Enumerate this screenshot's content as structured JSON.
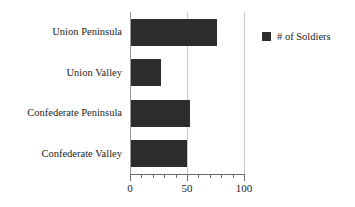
{
  "chart_data": {
    "type": "bar",
    "orientation": "horizontal",
    "title": "",
    "xlabel": "",
    "ylabel": "",
    "categories": [
      "Union Peninsula",
      "Union Valley",
      "Confederate Peninsula",
      "Confederate Valley"
    ],
    "values": [
      75,
      26,
      52,
      49
    ],
    "series": [
      {
        "name": "# of Soldiers",
        "values": [
          75,
          26,
          52,
          49
        ],
        "color": "#2c2c2c"
      }
    ],
    "xlim": [
      0,
      100
    ],
    "xticks": [
      0,
      50,
      100
    ],
    "xticklabels": [
      "0",
      "50",
      "100"
    ],
    "minor_tick_step": 10,
    "grid": true,
    "grid_axis": "x",
    "grid_color": "#c9c9c9",
    "legend": {
      "position": "right",
      "entries": [
        {
          "label": "# of Soldiers",
          "color": "#2c2c2c",
          "marker": "square"
        }
      ]
    },
    "background": "#ffffff",
    "axis_color": "#6b6b6b"
  }
}
